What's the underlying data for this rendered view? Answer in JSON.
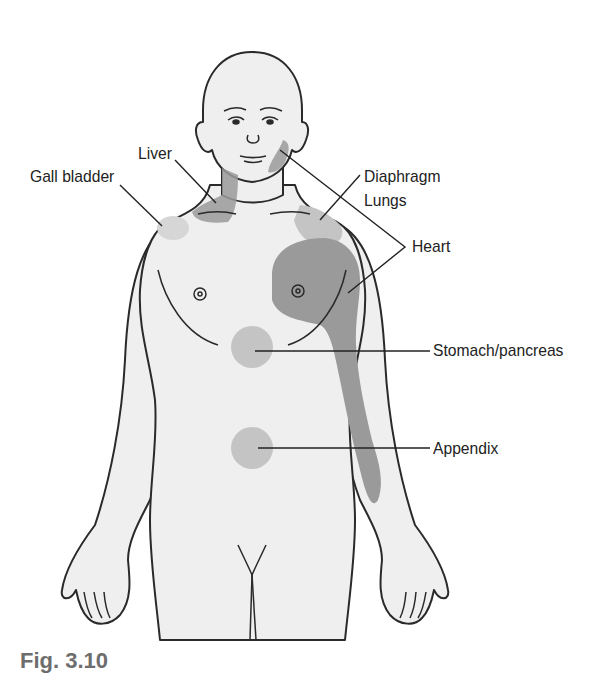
{
  "figure": {
    "type": "referred-pain-body-map",
    "colors": {
      "skin": "#efefef",
      "outline": "#2a2a2a",
      "dark_zone": "#9a9a9a",
      "light_zone": "#c4c4c4",
      "leader_line": "#222222"
    },
    "labels": {
      "liver": "Liver",
      "gall_bladder": "Gall bladder",
      "diaphragm": "Diaphragm",
      "lungs": "Lungs",
      "heart": "Heart",
      "stomach_pancreas": "Stomach/pancreas",
      "appendix": "Appendix"
    },
    "caption": "Fig. 3.10"
  }
}
